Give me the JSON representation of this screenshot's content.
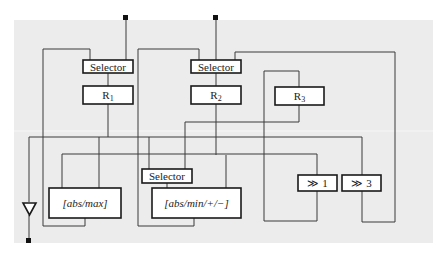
{
  "diagram": {
    "title": "",
    "colors": {
      "background": "#ececec",
      "box_fill": "#ffffff",
      "stroke": "#1a1a1a"
    },
    "blocks": {
      "selector1": {
        "label": "Selector"
      },
      "selector2": {
        "label": "Selector"
      },
      "selector3": {
        "label": "Selector"
      },
      "r1": {
        "label": "R",
        "sub": "1"
      },
      "r2": {
        "label": "R",
        "sub": "2"
      },
      "r3": {
        "label": "R",
        "sub": "3"
      },
      "absmax": {
        "label": "[abs/max]"
      },
      "absminpm": {
        "label": "[abs/min/+/−]"
      },
      "shift1": {
        "label": "≫ 1"
      },
      "shift3": {
        "label": "≫ 3"
      }
    },
    "terminals": [
      "input-1-top",
      "input-2-top",
      "output-bottom"
    ],
    "buffer": {
      "shape": "triangle-down"
    }
  }
}
